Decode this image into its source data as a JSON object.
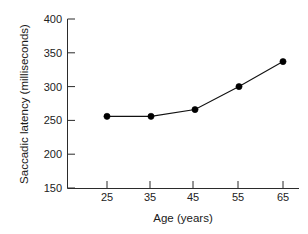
{
  "chart_data": {
    "type": "line",
    "title": "",
    "subtitle": "",
    "xlabel": "Age (years)",
    "ylabel": "Saccadic latency (milliseconds)",
    "x": [
      25,
      35,
      45,
      55,
      65
    ],
    "values": [
      256,
      256,
      266,
      300,
      337
    ],
    "series": [
      {
        "name": "Saccadic latency",
        "values": [
          256,
          256,
          266,
          300,
          337
        ]
      }
    ],
    "xtick_labels": [
      "25",
      "35",
      "45",
      "55",
      "65"
    ],
    "ytick_labels": [
      "150",
      "200",
      "250",
      "300",
      "350",
      "400"
    ],
    "xticks": [
      25,
      35,
      45,
      55,
      65
    ],
    "yticks": [
      150,
      200,
      250,
      300,
      350,
      400
    ],
    "xlim": [
      20,
      70
    ],
    "ylim": [
      150,
      400
    ],
    "grid": false,
    "legend": false,
    "legend_position": "none",
    "marker": "filled-circle",
    "line_color": "#111111",
    "marker_color": "#000000",
    "axis_color": "#2b2b2b",
    "background_color": "#ffffff",
    "annotations": []
  },
  "axes": {
    "y_title": "Saccadic latency (milliseconds)",
    "x_title": "Age (years)"
  }
}
